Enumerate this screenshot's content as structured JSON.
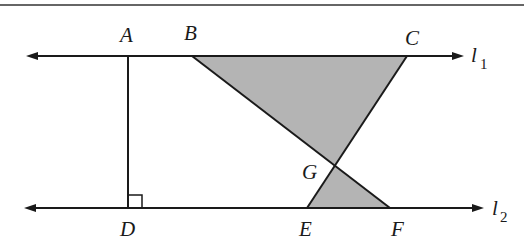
{
  "diagram": {
    "type": "geometry",
    "colors": {
      "line": "#1a1a1a",
      "shade": "#b4b4b4",
      "background": "#ffffff"
    },
    "lines": [
      {
        "id": "l1",
        "label": "l",
        "subscript": "1"
      },
      {
        "id": "l2",
        "label": "l",
        "subscript": "2"
      }
    ],
    "points": {
      "A": {
        "label": "A",
        "x": 128,
        "y": 56
      },
      "B": {
        "label": "B",
        "x": 192,
        "y": 56
      },
      "C": {
        "label": "C",
        "x": 407,
        "y": 56
      },
      "D": {
        "label": "D",
        "x": 128,
        "y": 208
      },
      "E": {
        "label": "E",
        "x": 307,
        "y": 208
      },
      "F": {
        "label": "F",
        "x": 390,
        "y": 208
      },
      "G": {
        "label": "G",
        "x": 335,
        "y": 166
      }
    },
    "shaded_regions": [
      "triangle BCG",
      "triangle GEF"
    ],
    "right_angle_at": "D"
  }
}
